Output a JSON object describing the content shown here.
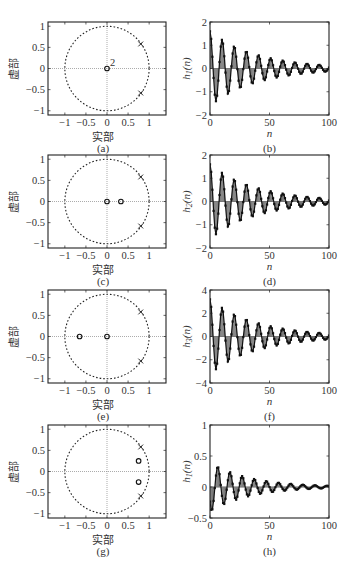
{
  "chart_data": [
    {
      "id": "a",
      "type": "scatter",
      "subtype": "pole-zero",
      "caption": "(a)",
      "xlabel": "实部",
      "ylabel": "虚部",
      "xlim": [
        -1.4,
        1.4
      ],
      "ylim": [
        -1.1,
        1.1
      ],
      "xticks": [
        -1,
        -0.5,
        0,
        0.5,
        1
      ],
      "xtick_labels": [
        "−1",
        "−0.5",
        "0",
        "0.5",
        "1"
      ],
      "yticks": [
        1,
        0.5,
        0,
        -0.5,
        -1
      ],
      "ytick_labels": [
        "1",
        "0.5",
        "0",
        "−0.5",
        "−1"
      ],
      "unit_circle": true,
      "zeros": [
        {
          "re": 0,
          "im": 0,
          "multiplicity": 2,
          "label": "2"
        }
      ],
      "poles": [
        {
          "re": 0.8,
          "im": 0.58
        },
        {
          "re": 0.8,
          "im": -0.58
        }
      ]
    },
    {
      "id": "b",
      "type": "bar",
      "subtype": "stem",
      "caption": "(b)",
      "xlabel": "n",
      "ylabel": "h",
      "ylabel_sub": "1",
      "ylabel_suffix": "(n)",
      "xlim": [
        0,
        100
      ],
      "ylim": [
        -2,
        2
      ],
      "xticks": [
        0,
        50,
        100
      ],
      "yticks": [
        2,
        1,
        0,
        -1,
        -2
      ],
      "ytick_labels": [
        "2",
        "1",
        "0",
        "−1",
        "−2"
      ],
      "amplitude": 1.6,
      "decay": 0.975,
      "period": 10.2,
      "phase": 0
    },
    {
      "id": "c",
      "type": "scatter",
      "subtype": "pole-zero",
      "caption": "(c)",
      "xlabel": "实部",
      "ylabel": "虚部",
      "xlim": [
        -1.4,
        1.4
      ],
      "ylim": [
        -1.1,
        1.1
      ],
      "xticks": [
        -1,
        -0.5,
        0,
        0.5,
        1
      ],
      "xtick_labels": [
        "−1",
        "−0.5",
        "0",
        "0.5",
        "1"
      ],
      "yticks": [
        1,
        0.5,
        0,
        -0.5,
        -1
      ],
      "ytick_labels": [
        "1",
        "0.5",
        "0",
        "−0.5",
        "−1"
      ],
      "unit_circle": true,
      "zeros": [
        {
          "re": 0,
          "im": 0
        },
        {
          "re": 0.33,
          "im": 0
        }
      ],
      "poles": [
        {
          "re": 0.8,
          "im": 0.58
        },
        {
          "re": 0.8,
          "im": -0.58
        }
      ]
    },
    {
      "id": "d",
      "type": "bar",
      "subtype": "stem",
      "caption": "(d)",
      "xlabel": "n",
      "ylabel": "h",
      "ylabel_sub": "2",
      "ylabel_suffix": "(n)",
      "xlim": [
        0,
        100
      ],
      "ylim": [
        -2,
        2
      ],
      "xticks": [
        0,
        50,
        100
      ],
      "yticks": [
        2,
        1,
        0,
        -1,
        -2
      ],
      "ytick_labels": [
        "2",
        "1",
        "0",
        "−1",
        "−2"
      ],
      "amplitude": 1.6,
      "decay": 0.975,
      "period": 10.2,
      "phase": 0
    },
    {
      "id": "e",
      "type": "scatter",
      "subtype": "pole-zero",
      "caption": "(e)",
      "xlabel": "实部",
      "ylabel": "虚部",
      "xlim": [
        -1.4,
        1.4
      ],
      "ylim": [
        -1.1,
        1.1
      ],
      "xticks": [
        -1,
        -0.5,
        0,
        0.5,
        1
      ],
      "xtick_labels": [
        "−1",
        "−0.5",
        "0",
        "0.5",
        "1"
      ],
      "yticks": [
        1,
        0.5,
        0,
        -0.5,
        -1
      ],
      "ytick_labels": [
        "1",
        "0.5",
        "0",
        "−0.5",
        "−1"
      ],
      "unit_circle": true,
      "zeros": [
        {
          "re": 0,
          "im": 0
        },
        {
          "re": -0.65,
          "im": 0
        }
      ],
      "poles": [
        {
          "re": 0.8,
          "im": 0.58
        },
        {
          "re": 0.8,
          "im": -0.58
        }
      ]
    },
    {
      "id": "f",
      "type": "bar",
      "subtype": "stem",
      "caption": "(f)",
      "xlabel": "n",
      "ylabel": "h",
      "ylabel_sub": "3",
      "ylabel_suffix": "(n)",
      "xlim": [
        0,
        100
      ],
      "ylim": [
        -4,
        4
      ],
      "xticks": [
        0,
        50,
        100
      ],
      "yticks": [
        4,
        2,
        0,
        -2,
        -4
      ],
      "ytick_labels": [
        "4",
        "2",
        "0",
        "−2",
        "−4"
      ],
      "amplitude": 3.2,
      "decay": 0.975,
      "period": 10.2,
      "phase": 0
    },
    {
      "id": "g",
      "type": "scatter",
      "subtype": "pole-zero",
      "caption": "(g)",
      "xlabel": "实部",
      "ylabel": "虚部",
      "xlim": [
        -1.4,
        1.4
      ],
      "ylim": [
        -1.1,
        1.1
      ],
      "xticks": [
        -1,
        -0.5,
        0,
        0.5,
        1
      ],
      "xtick_labels": [
        "−1",
        "−0.5",
        "0",
        "0.5",
        "1"
      ],
      "yticks": [
        1,
        0.5,
        0,
        -0.5,
        -1
      ],
      "ytick_labels": [
        "1",
        "0.5",
        "0",
        "−0.5",
        "−1"
      ],
      "unit_circle": true,
      "zeros": [
        {
          "re": 0.75,
          "im": 0.25
        },
        {
          "re": 0.75,
          "im": -0.25
        }
      ],
      "poles": [
        {
          "re": 0.8,
          "im": 0.58
        },
        {
          "re": 0.8,
          "im": -0.58
        }
      ]
    },
    {
      "id": "h",
      "type": "bar",
      "subtype": "stem",
      "caption": "(h)",
      "xlabel": "n",
      "ylabel": "h",
      "ylabel_sub": "1",
      "ylabel_suffix": "(n)",
      "xlim": [
        0,
        100
      ],
      "ylim": [
        -0.5,
        1
      ],
      "xticks": [
        0,
        50,
        100
      ],
      "yticks": [
        1,
        0.5,
        0,
        -0.5
      ],
      "ytick_labels": [
        "1",
        "0.5",
        "0",
        "−0.5"
      ],
      "amplitude": 0.4,
      "decay": 0.97,
      "period": 10.2,
      "phase": 2.2
    }
  ],
  "layout": {
    "rows_top": [
      22,
      155,
      290,
      425
    ],
    "plot_height": 93,
    "left_plot": {
      "x": 48,
      "w": 118
    },
    "right_plot": {
      "x": 210,
      "w": 119
    }
  },
  "colors": {
    "axis": "#222222",
    "stem_fill": "#9a9a9a",
    "grid": "#888888",
    "marker": "#111111"
  }
}
